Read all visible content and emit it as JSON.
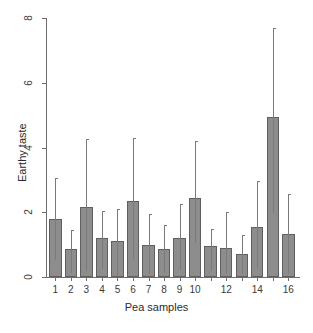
{
  "chart_data": {
    "type": "bar",
    "title": "",
    "xlabel": "Pea samples",
    "ylabel": "Earthy taste",
    "ylim": [
      0,
      8
    ],
    "yticks": [
      0,
      2,
      4,
      6,
      8
    ],
    "ytick_labels": [
      "0",
      "2",
      "4",
      "6",
      "8"
    ],
    "grid": false,
    "legend": null,
    "categories": [
      "1",
      "2",
      "3",
      "4",
      "5",
      "6",
      "7",
      "8",
      "9",
      "10",
      "11",
      "12",
      "13",
      "14",
      "15",
      "16"
    ],
    "xtick_labels": [
      "1",
      "2",
      "3",
      "4",
      "5",
      "6",
      "7",
      "8",
      "9",
      "10",
      "",
      "12",
      "",
      "14",
      "",
      "16"
    ],
    "values": [
      1.8,
      0.85,
      2.16,
      1.2,
      1.1,
      2.35,
      1.0,
      0.88,
      1.22,
      2.44,
      0.95,
      0.9,
      0.7,
      1.55,
      4.94,
      1.33
    ],
    "error_high": [
      3.05,
      1.45,
      4.25,
      2.05,
      2.1,
      4.28,
      1.95,
      1.62,
      2.25,
      4.2,
      1.48,
      2.0,
      1.3,
      2.95,
      7.7,
      2.55
    ],
    "error_low": [
      0.52,
      0.12,
      0.18,
      0.25,
      0.05,
      0.55,
      0.1,
      0.12,
      0.22,
      1.05,
      0.2,
      0.1,
      0.08,
      0.28,
      1.98,
      0.1
    ],
    "bar_color": "#8d8d8d",
    "bar_border_color": "#5f5f5f",
    "axis_color": "#6e6e6e",
    "error_bar_color": "#7a7a7a",
    "background": "#ffffff"
  }
}
